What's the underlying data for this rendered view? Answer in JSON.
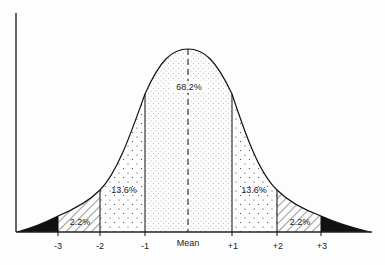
{
  "diagram": {
    "type": "normal-distribution",
    "regions": [
      {
        "id": "center",
        "label": "68.2%",
        "range": "-1 to +1",
        "fill": "fine-dots"
      },
      {
        "id": "left-mid",
        "label": "13.6%",
        "range": "-2 to -1",
        "fill": "sparse-dots"
      },
      {
        "id": "right-mid",
        "label": "13.6%",
        "range": "+1 to +2",
        "fill": "sparse-dots"
      },
      {
        "id": "left-outer",
        "label": "2.2%",
        "range": "-3 to -2",
        "fill": "hatch"
      },
      {
        "id": "right-outer",
        "label": "2.2%",
        "range": "+2 to +3",
        "fill": "hatch"
      },
      {
        "id": "left-tail",
        "label": "",
        "range": "< -3",
        "fill": "solid-black"
      },
      {
        "id": "right-tail",
        "label": "",
        "range": "> +3",
        "fill": "solid-black"
      }
    ],
    "ticks": [
      "-3",
      "-2",
      "-1",
      "Mean",
      "+1",
      "+2",
      "+3"
    ],
    "labels": {
      "center": "68.2%",
      "left_mid": "13.6%",
      "right_mid": "13.6%",
      "left_outer": "2.2%",
      "right_outer": "2.2%"
    }
  }
}
